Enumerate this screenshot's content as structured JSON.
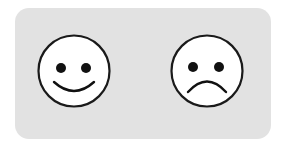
{
  "panel": {
    "background": "#e2e2e2"
  },
  "faces": [
    {
      "name": "happy-face",
      "icon": "smiley-face-icon",
      "expression": "happy",
      "fill": "#ffffff",
      "stroke": "#1a1a1a"
    },
    {
      "name": "sad-face",
      "icon": "frowning-face-icon",
      "expression": "sad",
      "fill": "#ffffff",
      "stroke": "#1a1a1a"
    }
  ]
}
